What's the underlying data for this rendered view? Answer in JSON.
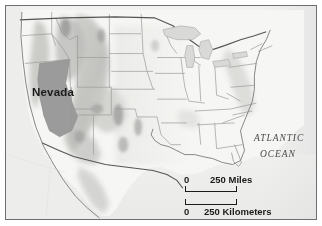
{
  "figure": {
    "type": "reference-map",
    "region": "Contiguous United States",
    "highlighted_state": "Nevada",
    "frame_color": "#6e6e6e",
    "background_color": "#ffffff"
  },
  "labels": {
    "state_label": "Nevada",
    "ocean_label_line1": "ATLANTIC",
    "ocean_label_line2": "OCEAN"
  },
  "scale": {
    "miles": {
      "zero": "0",
      "value_label": "250 Miles",
      "value": 250,
      "unit": "Miles"
    },
    "kilometers": {
      "zero": "0",
      "value_label": "250 Kilometers",
      "value": 250,
      "unit": "Kilometers"
    }
  },
  "colors": {
    "land_base": "#f3f3f1",
    "highlight_fill": "#9b9b9b",
    "relief_shadow": "#b8b8b6",
    "water": "#ececec",
    "border_line": "#8a8a8a",
    "coast_line": "#6f6f6f",
    "label_text": "#1a1a1a"
  }
}
